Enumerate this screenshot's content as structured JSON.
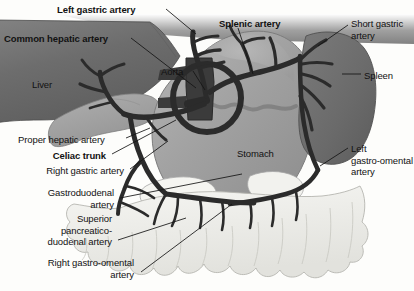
{
  "figure": {
    "background_color": "#fdfdfb",
    "line_color": "#141414",
    "artery_color": "#2f2f2f"
  },
  "labels": [
    {
      "id": "left-gastric-artery",
      "text": "Left gastric artery",
      "bold": true,
      "align": "left",
      "x": 57,
      "y": 4
    },
    {
      "id": "common-hepatic-artery",
      "text": "Common hepatic artery",
      "bold": true,
      "align": "left",
      "x": 4,
      "y": 33
    },
    {
      "id": "liver",
      "text": "Liver",
      "bold": false,
      "align": "left",
      "x": 32,
      "y": 79
    },
    {
      "id": "aorta",
      "text": "Aorta",
      "bold": false,
      "align": "left",
      "x": 161,
      "y": 66
    },
    {
      "id": "splenic-artery",
      "text": "Splenic artery",
      "bold": true,
      "align": "left",
      "x": 219,
      "y": 18
    },
    {
      "id": "short-gastric-artery",
      "text": "Short gastric\nartery",
      "bold": false,
      "align": "left",
      "x": 351,
      "y": 18
    },
    {
      "id": "spleen",
      "text": "Spleen",
      "bold": false,
      "align": "left",
      "x": 364,
      "y": 70
    },
    {
      "id": "proper-hepatic-artery",
      "text": "Proper hepatic artery",
      "bold": false,
      "align": "left",
      "x": 18,
      "y": 134
    },
    {
      "id": "celiac-trunk",
      "text": "Celiac trunk",
      "bold": true,
      "align": "right",
      "x": 48,
      "y": 150
    },
    {
      "id": "right-gastric-artery",
      "text": "Right gastric artery",
      "bold": false,
      "align": "right",
      "x": 22,
      "y": 165
    },
    {
      "id": "stomach",
      "text": "Stomach",
      "bold": false,
      "align": "left",
      "x": 237,
      "y": 148
    },
    {
      "id": "left-gastro-omental-artery",
      "text": "Left\ngastro-omental\nartery",
      "bold": false,
      "align": "left",
      "x": 351,
      "y": 143
    },
    {
      "id": "gastroduodenal-artery",
      "text": "Gastroduodenal\nartery",
      "bold": false,
      "align": "right",
      "x": 24,
      "y": 187
    },
    {
      "id": "superior-pancreaticoduodenal-artery",
      "text": "Superior\npancreatico-\nduodenal artery",
      "bold": false,
      "align": "right",
      "x": 16,
      "y": 213
    },
    {
      "id": "right-gastro-omental-artery",
      "text": "Right gastro-omental\nartery",
      "bold": false,
      "align": "right",
      "x": 7,
      "y": 257
    }
  ],
  "structures": [
    {
      "id": "liver",
      "name": "Liver",
      "shade": "#6f6f6f"
    },
    {
      "id": "gallbladder-duodenum",
      "name": "Gallbladder and duodenum",
      "shade": "#9c9c9c"
    },
    {
      "id": "stomach",
      "name": "Stomach",
      "shade": "#a6a6a6"
    },
    {
      "id": "spleen",
      "name": "Spleen",
      "shade": "#6d6d6d"
    },
    {
      "id": "greater-omentum",
      "name": "Greater omentum",
      "shade": "#ededea"
    },
    {
      "id": "pancreas",
      "name": "Pancreas",
      "shade": "#f4f4f0"
    },
    {
      "id": "aorta",
      "name": "Aorta",
      "shade": "#3a3a3a"
    },
    {
      "id": "arterial-tree",
      "name": "Celiac arterial tree",
      "shade": "#2b2b2b"
    }
  ]
}
